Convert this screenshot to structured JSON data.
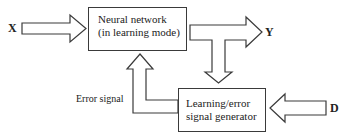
{
  "diagram": {
    "nodes": {
      "neural_network": {
        "line1": "Neural network",
        "line2": "(in learning mode)"
      },
      "learning_generator": {
        "line1": "Learning/error",
        "line2": "signal generator"
      }
    },
    "signals": {
      "input": "X",
      "output": "Y",
      "desired": "D",
      "error": "Error signal"
    },
    "edges": [
      {
        "from": "X",
        "to": "Neural network"
      },
      {
        "from": "Neural network",
        "to": "Y"
      },
      {
        "from": "Neural network",
        "to": "Learning/error signal generator"
      },
      {
        "from": "D",
        "to": "Learning/error signal generator"
      },
      {
        "from": "Learning/error signal generator",
        "to": "Neural network",
        "label": "Error signal"
      }
    ],
    "colors": {
      "stroke": "#3a3a3a",
      "text": "#222222",
      "background": "#ffffff"
    }
  }
}
